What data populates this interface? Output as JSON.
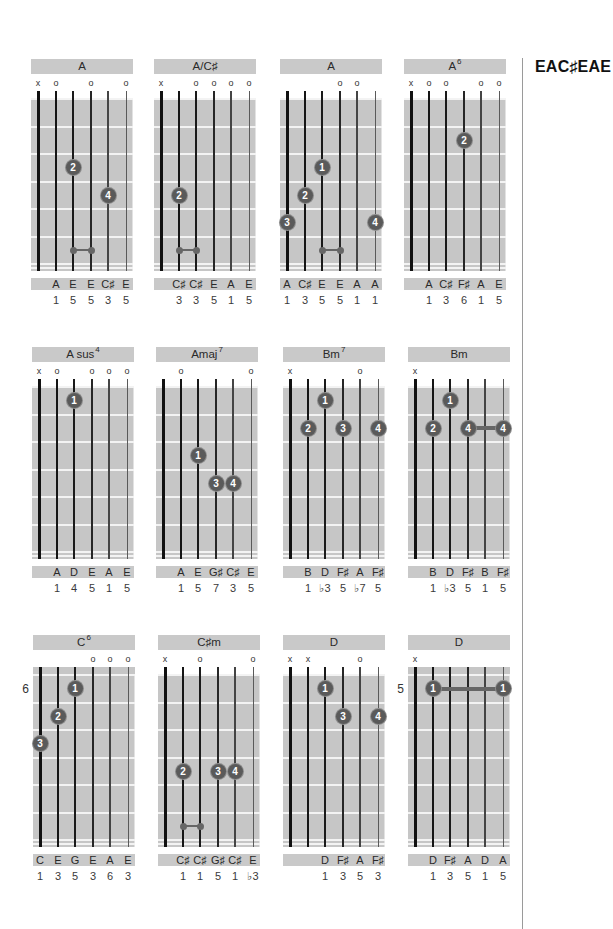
{
  "tuning_title": "EAC♯EAE",
  "chords": [
    {
      "name": "A",
      "sup": "",
      "position": "",
      "open_nut": true,
      "markers": [
        "x",
        "o",
        "",
        "o",
        "",
        "o"
      ],
      "dots": [
        {
          "string": 3,
          "fret": 3,
          "finger": "2"
        },
        {
          "string": 5,
          "fret": 4,
          "finger": "4"
        }
      ],
      "links": [
        {
          "from": 3,
          "to": 4,
          "fret": 6
        }
      ],
      "barres": [],
      "notes": [
        "",
        "A",
        "E",
        "E",
        "C♯",
        "E"
      ],
      "intervals": [
        "",
        "1",
        "5",
        "5",
        "3",
        "5"
      ]
    },
    {
      "name": "A/C♯",
      "sup": "",
      "position": "",
      "open_nut": true,
      "markers": [
        "x",
        "",
        "o",
        "o",
        "o",
        "o"
      ],
      "dots": [
        {
          "string": 2,
          "fret": 4,
          "finger": "2"
        }
      ],
      "links": [
        {
          "from": 2,
          "to": 3,
          "fret": 6
        }
      ],
      "barres": [],
      "notes": [
        "",
        "C♯",
        "C♯",
        "E",
        "A",
        "E"
      ],
      "intervals": [
        "",
        "3",
        "3",
        "5",
        "1",
        "5"
      ]
    },
    {
      "name": "A",
      "sup": "",
      "position": "",
      "open_nut": true,
      "markers": [
        "",
        "",
        "",
        "o",
        "o",
        ""
      ],
      "dots": [
        {
          "string": 3,
          "fret": 3,
          "finger": "1"
        },
        {
          "string": 2,
          "fret": 4,
          "finger": "2"
        },
        {
          "string": 1,
          "fret": 5,
          "finger": "3"
        },
        {
          "string": 6,
          "fret": 5,
          "finger": "4"
        }
      ],
      "links": [
        {
          "from": 3,
          "to": 4,
          "fret": 6
        }
      ],
      "barres": [],
      "notes": [
        "A",
        "C♯",
        "E",
        "E",
        "A",
        "A"
      ],
      "intervals": [
        "1",
        "3",
        "5",
        "5",
        "1",
        "1"
      ]
    },
    {
      "name": "A",
      "sup": "6",
      "position": "",
      "open_nut": true,
      "markers": [
        "x",
        "o",
        "o",
        "",
        "o",
        "o"
      ],
      "dots": [
        {
          "string": 4,
          "fret": 2,
          "finger": "2"
        }
      ],
      "links": [],
      "barres": [],
      "notes": [
        "",
        "A",
        "C♯",
        "F♯",
        "A",
        "E"
      ],
      "intervals": [
        "",
        "1",
        "3",
        "6",
        "1",
        "5"
      ]
    },
    {
      "name": "A sus",
      "sup": "4",
      "position": "",
      "open_nut": true,
      "markers": [
        "x",
        "o",
        "",
        "o",
        "o",
        "o"
      ],
      "dots": [
        {
          "string": 3,
          "fret": 1,
          "finger": "1"
        }
      ],
      "links": [],
      "barres": [],
      "notes": [
        "",
        "A",
        "D",
        "E",
        "A",
        "E"
      ],
      "intervals": [
        "",
        "1",
        "4",
        "5",
        "1",
        "5"
      ]
    },
    {
      "name": "Amaj",
      "sup": "7",
      "position": "",
      "open_nut": true,
      "markers": [
        "",
        "o",
        "",
        "",
        "",
        "o"
      ],
      "dots": [
        {
          "string": 3,
          "fret": 3,
          "finger": "1"
        },
        {
          "string": 4,
          "fret": 4,
          "finger": "3"
        },
        {
          "string": 5,
          "fret": 4,
          "finger": "4"
        }
      ],
      "links": [],
      "barres": [],
      "notes": [
        "",
        "A",
        "E",
        "G♯",
        "C♯",
        "E"
      ],
      "intervals": [
        "",
        "1",
        "5",
        "7",
        "3",
        "5"
      ]
    },
    {
      "name": "Bm",
      "sup": "7",
      "position": "",
      "open_nut": true,
      "markers": [
        "x",
        "",
        "",
        "",
        "o",
        ""
      ],
      "dots": [
        {
          "string": 3,
          "fret": 1,
          "finger": "1"
        },
        {
          "string": 2,
          "fret": 2,
          "finger": "2"
        },
        {
          "string": 4,
          "fret": 2,
          "finger": "3"
        },
        {
          "string": 6,
          "fret": 2,
          "finger": "4"
        }
      ],
      "links": [],
      "barres": [],
      "notes": [
        "",
        "B",
        "D",
        "F♯",
        "A",
        "F♯"
      ],
      "intervals": [
        "",
        "1",
        "♭3",
        "5",
        "♭7",
        "5"
      ]
    },
    {
      "name": "Bm",
      "sup": "",
      "position": "",
      "open_nut": true,
      "markers": [
        "x",
        "",
        "",
        "",
        "",
        ""
      ],
      "dots": [
        {
          "string": 3,
          "fret": 1,
          "finger": "1"
        },
        {
          "string": 2,
          "fret": 2,
          "finger": "2"
        },
        {
          "string": 4,
          "fret": 2,
          "finger": "4"
        },
        {
          "string": 6,
          "fret": 2,
          "finger": "4"
        }
      ],
      "links": [],
      "barres": [
        {
          "from": 4,
          "to": 6,
          "fret": 2
        }
      ],
      "notes": [
        "",
        "B",
        "D",
        "F♯",
        "B",
        "F♯"
      ],
      "intervals": [
        "",
        "1",
        "♭3",
        "5",
        "1",
        "5"
      ]
    },
    {
      "name": "C",
      "sup": "6",
      "position": "6",
      "open_nut": false,
      "markers": [
        "",
        "",
        "",
        "o",
        "o",
        "o"
      ],
      "dots": [
        {
          "string": 3,
          "fret": 1,
          "finger": "1"
        },
        {
          "string": 2,
          "fret": 2,
          "finger": "2"
        },
        {
          "string": 1,
          "fret": 3,
          "finger": "3"
        }
      ],
      "links": [],
      "barres": [],
      "notes": [
        "C",
        "E",
        "G",
        "E",
        "A",
        "E"
      ],
      "intervals": [
        "1",
        "3",
        "5",
        "3",
        "6",
        "3"
      ]
    },
    {
      "name": "C♯m",
      "sup": "",
      "position": "",
      "open_nut": true,
      "markers": [
        "x",
        "",
        "o",
        "",
        "",
        "o"
      ],
      "dots": [
        {
          "string": 2,
          "fret": 4,
          "finger": "2"
        },
        {
          "string": 4,
          "fret": 4,
          "finger": "3"
        },
        {
          "string": 5,
          "fret": 4,
          "finger": "4"
        }
      ],
      "links": [
        {
          "from": 2,
          "to": 3,
          "fret": 6
        }
      ],
      "barres": [],
      "notes": [
        "",
        "C♯",
        "C♯",
        "G♯",
        "C♯",
        "E"
      ],
      "intervals": [
        "",
        "1",
        "1",
        "5",
        "1",
        "♭3"
      ]
    },
    {
      "name": "D",
      "sup": "",
      "position": "",
      "open_nut": true,
      "markers": [
        "x",
        "x",
        "",
        "",
        "o",
        ""
      ],
      "dots": [
        {
          "string": 3,
          "fret": 1,
          "finger": "1"
        },
        {
          "string": 4,
          "fret": 2,
          "finger": "3"
        },
        {
          "string": 6,
          "fret": 2,
          "finger": "4"
        }
      ],
      "links": [],
      "barres": [],
      "notes": [
        "",
        "",
        "D",
        "F♯",
        "A",
        "F♯"
      ],
      "intervals": [
        "",
        "",
        "1",
        "3",
        "5",
        "3"
      ]
    },
    {
      "name": "D",
      "sup": "",
      "position": "5",
      "open_nut": false,
      "markers": [
        "x",
        "",
        "",
        "",
        "",
        ""
      ],
      "dots": [
        {
          "string": 2,
          "fret": 1,
          "finger": "1"
        },
        {
          "string": 6,
          "fret": 1,
          "finger": "1"
        }
      ],
      "links": [],
      "barres": [
        {
          "from": 2,
          "to": 6,
          "fret": 1
        }
      ],
      "notes": [
        "",
        "D",
        "F♯",
        "A",
        "D",
        "A"
      ],
      "intervals": [
        "",
        "1",
        "3",
        "5",
        "1",
        "5"
      ]
    }
  ]
}
